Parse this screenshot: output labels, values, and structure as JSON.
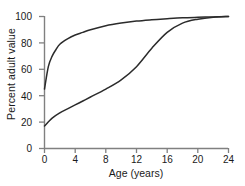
{
  "chart_data": {
    "type": "line",
    "title": "",
    "subtitle": "",
    "xlabel": "Age (years)",
    "ylabel": "Percent adult value",
    "xlim": [
      0,
      24
    ],
    "ylim": [
      0,
      100
    ],
    "xticks": [
      0,
      4,
      8,
      12,
      16,
      20,
      24
    ],
    "yticks": [
      0,
      20,
      40,
      60,
      80,
      100
    ],
    "xtick_labels": [
      "0",
      "4",
      "8",
      "12",
      "16",
      "20",
      "24"
    ],
    "ytick_labels": [
      "0",
      "20",
      "40",
      "60",
      "80",
      "100"
    ],
    "grid": false,
    "legend": "none",
    "series": [
      {
        "name": "neural-growth-curve",
        "color": "#2b2b2b",
        "x": [
          0,
          0.5,
          1,
          1.5,
          2,
          3,
          4,
          5,
          6,
          8,
          10,
          12,
          14,
          16,
          18,
          20,
          22,
          24
        ],
        "values": [
          45,
          62,
          70,
          75,
          79,
          83,
          86,
          88,
          90,
          93,
          95,
          96.5,
          97.5,
          98.3,
          99,
          99.4,
          99.7,
          100
        ]
      },
      {
        "name": "general-growth-curve",
        "color": "#2b2b2b",
        "x": [
          0,
          1,
          2,
          3,
          4,
          5,
          6,
          8,
          10,
          12,
          14,
          16,
          18,
          20,
          22,
          24
        ],
        "values": [
          17,
          23,
          27,
          30,
          33,
          36,
          39,
          45,
          52,
          62,
          76,
          88,
          95,
          98,
          99.5,
          100
        ]
      }
    ],
    "axis_color": "#808080",
    "line_color": "#2b2b2b"
  }
}
